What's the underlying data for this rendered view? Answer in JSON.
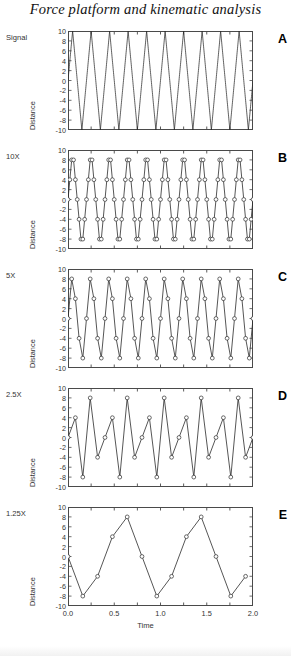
{
  "figure": {
    "title": "Force platform and kinematic analysis",
    "panel_letters": [
      "A",
      "B",
      "C",
      "D",
      "E"
    ],
    "row_labels": [
      "Signal",
      "10X",
      "5X",
      "2.5X",
      "1.25X"
    ],
    "y_axis_label": "Distance",
    "x_axis_label": "Time",
    "y_ticks": [
      "10",
      "8",
      "6",
      "4",
      "2",
      "0",
      "-2",
      "-4",
      "-6",
      "-8",
      "-10"
    ],
    "x_ticks": [
      "0.0",
      "0.5",
      "1.0",
      "1.5",
      "2.0"
    ],
    "line_color": "#2b2b2b",
    "marker_color": "#2b2b2b",
    "axis_color": "#4a4a4a"
  },
  "chart_data": [
    {
      "type": "line",
      "panel": "A",
      "title": "Signal",
      "xlabel": "Time",
      "ylabel": "Distance",
      "xlim": [
        0.0,
        2.0
      ],
      "ylim": [
        -10,
        10
      ],
      "yticks": [
        10,
        8,
        6,
        4,
        2,
        0,
        -2,
        -4,
        -6,
        -8,
        -10
      ],
      "xticks": [
        0.0,
        0.5,
        1.0,
        1.5,
        2.0
      ],
      "grid": false,
      "legend": "none",
      "markers": false,
      "waveform": "triangle",
      "frequency_hz": 5,
      "amplitude": 10,
      "cycles_shown": 10,
      "samples_per_cycle": 100,
      "note": "Continuous reference triangular signal"
    },
    {
      "type": "line",
      "panel": "B",
      "title": "10X",
      "xlabel": "Time",
      "ylabel": "Distance",
      "xlim": [
        0.0,
        2.0
      ],
      "ylim": [
        -10,
        10
      ],
      "yticks": [
        10,
        8,
        6,
        4,
        2,
        0,
        -2,
        -4,
        -6,
        -8,
        -10
      ],
      "grid": false,
      "legend": "none",
      "markers": true,
      "waveform": "triangle",
      "frequency_hz": 5,
      "amplitude": 10,
      "sample_rate_hz": 50,
      "samples_per_cycle": 10,
      "note": "Sampled at 10 times the signal frequency"
    },
    {
      "type": "line",
      "panel": "C",
      "title": "5X",
      "xlabel": "Time",
      "ylabel": "Distance",
      "xlim": [
        0.0,
        2.0
      ],
      "ylim": [
        -10,
        10
      ],
      "yticks": [
        10,
        8,
        6,
        4,
        2,
        0,
        -2,
        -4,
        -6,
        -8,
        -10
      ],
      "grid": false,
      "legend": "none",
      "markers": true,
      "waveform": "triangle",
      "frequency_hz": 5,
      "amplitude": 10,
      "sample_rate_hz": 25,
      "samples_per_cycle": 5,
      "note": "Sampled at 5 times the signal frequency"
    },
    {
      "type": "line",
      "panel": "D",
      "title": "2.5X",
      "xlabel": "Time",
      "ylabel": "Distance",
      "xlim": [
        0.0,
        2.0
      ],
      "ylim": [
        -10,
        10
      ],
      "yticks": [
        10,
        8,
        6,
        4,
        2,
        0,
        -2,
        -4,
        -6,
        -8,
        -10
      ],
      "grid": false,
      "legend": "none",
      "markers": true,
      "waveform": "triangle",
      "frequency_hz": 5,
      "amplitude": 10,
      "sample_rate_hz": 12.5,
      "samples_per_cycle": 2.5,
      "note": "Sampled at 2.5 times the signal frequency; aliasing visible"
    },
    {
      "type": "line",
      "panel": "E",
      "title": "1.25X",
      "xlabel": "Time",
      "ylabel": "Distance",
      "xlim": [
        0.0,
        2.0
      ],
      "ylim": [
        -10,
        10
      ],
      "yticks": [
        10,
        8,
        6,
        4,
        2,
        0,
        -2,
        -4,
        -6,
        -8,
        -10
      ],
      "grid": false,
      "legend": "none",
      "markers": true,
      "waveform": "triangle",
      "frequency_hz": 5,
      "amplitude": 10,
      "sample_rate_hz": 6.25,
      "samples_per_cycle": 1.25,
      "note": "Sampled at 1.25 times the signal frequency; severe aliasing, apparent frequency reduced"
    }
  ]
}
